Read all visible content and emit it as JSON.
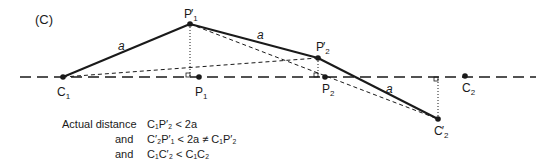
{
  "panel_label": "(C)",
  "points": {
    "C1": {
      "label": "C",
      "sub": "1",
      "prime": false
    },
    "P1p": {
      "label": "P",
      "sub": "1",
      "prime": true
    },
    "P1": {
      "label": "P",
      "sub": "1",
      "prime": false
    },
    "P2p": {
      "label": "P",
      "sub": "2",
      "prime": true
    },
    "P2": {
      "label": "P",
      "sub": "2",
      "prime": false
    },
    "C2p": {
      "label": "C",
      "sub": "2",
      "prime": true
    },
    "C2": {
      "label": "C",
      "sub": "2",
      "prime": false
    }
  },
  "segment_label": "a",
  "equations": {
    "row1_lead": "Actual distance",
    "row1_expr": "C₁P′₂ < 2a",
    "row2_lead": "and",
    "row2_expr": "C′₂P′₁ < 2a ≠ C₁P′₂",
    "row3_lead": "and",
    "row3_expr": "C₁C′₂ < C₁C₂"
  }
}
